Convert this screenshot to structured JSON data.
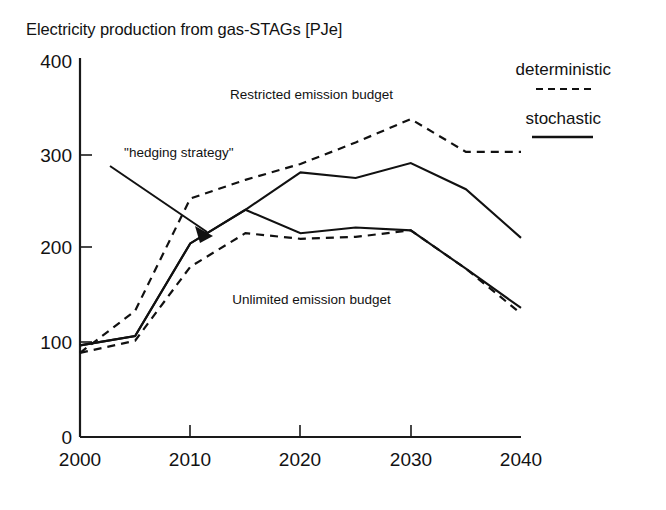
{
  "chart_data": {
    "type": "line",
    "title": "Electricity production from gas-STAGs [PJe]",
    "xlabel": "",
    "ylabel": "",
    "xlim": [
      2000,
      2040
    ],
    "ylim": [
      0,
      400
    ],
    "xticks": [
      "2000",
      "2010",
      "2020",
      "2030",
      "2040"
    ],
    "yticks": [
      "0",
      "100",
      "200",
      "300",
      "400"
    ],
    "grid": false,
    "legend_position": "top-right",
    "x": [
      2000,
      2005,
      2010,
      2015,
      2020,
      2025,
      2030,
      2035,
      2040
    ],
    "series": [
      {
        "name": "Restricted emission budget - deterministic",
        "style": "dashed",
        "values": [
          90,
          135,
          255,
          275,
          292,
          315,
          340,
          305,
          305
        ]
      },
      {
        "name": "Restricted emission budget - stochastic",
        "style": "solid",
        "values": [
          98,
          108,
          207,
          243,
          283,
          277,
          293,
          265,
          213
        ]
      },
      {
        "name": "Unlimited emission budget - stochastic",
        "style": "solid",
        "values": [
          98,
          108,
          207,
          243,
          218,
          224,
          221,
          180,
          138
        ]
      },
      {
        "name": "Unlimited emission budget - deterministic",
        "style": "dashed",
        "values": [
          90,
          103,
          182,
          218,
          212,
          214,
          221,
          180,
          132
        ]
      }
    ],
    "annotations": [
      {
        "text": "Restricted emission budget",
        "x": 2021,
        "y": 362
      },
      {
        "text": "Unlimited emission budget",
        "x": 2021,
        "y": 142
      },
      {
        "text": "\"hedging strategy\"",
        "x": 2004,
        "y": 300
      }
    ],
    "legend": [
      {
        "label": "deterministic",
        "style": "dashed"
      },
      {
        "label": "stochastic",
        "style": "solid"
      }
    ]
  }
}
